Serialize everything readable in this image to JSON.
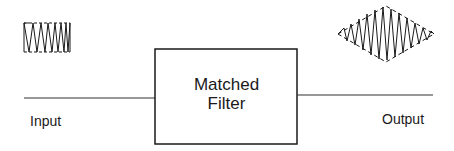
{
  "diagram": {
    "block": {
      "line1": "Matched",
      "line2": "Filter"
    },
    "input_label": "Input",
    "output_label": "Output",
    "input_signal": "rectangular-envelope chirp pulse",
    "output_signal": "compressed pulse with triangular envelope"
  },
  "colors": {
    "stroke": "#1a1a1a",
    "background": "#ffffff"
  }
}
